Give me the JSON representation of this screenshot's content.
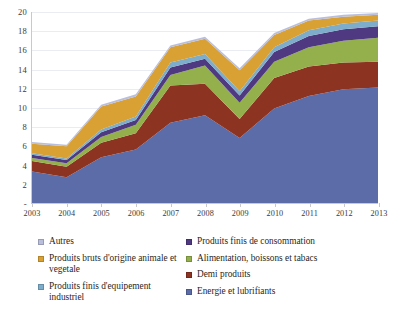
{
  "chart_data": {
    "type": "area",
    "stacked": true,
    "title": "",
    "subtitle": "",
    "xlabel": "",
    "ylabel": "",
    "grid": true,
    "legend_position": "bottom",
    "xlim": [
      2003,
      2013
    ],
    "ylim": [
      0,
      20
    ],
    "yticks": [
      0,
      2,
      4,
      6,
      8,
      10,
      12,
      14,
      16,
      18,
      20
    ],
    "ytick_labels": [
      "-",
      "2",
      "4",
      "6",
      "8",
      "10",
      "12",
      "14",
      "16",
      "18",
      "20"
    ],
    "categories": [
      "2003",
      "2004",
      "2005",
      "2006",
      "2007",
      "2008",
      "2009",
      "2010",
      "2011",
      "2012",
      "2013"
    ],
    "x": [
      2003,
      2004,
      2005,
      2006,
      2007,
      2008,
      2009,
      2010,
      2011,
      2012,
      2013
    ],
    "series": [
      {
        "name": "Energie et lubrifiants",
        "color": "#5b6ca8",
        "values": [
          3.3,
          2.7,
          4.8,
          5.6,
          8.4,
          9.2,
          6.8,
          9.9,
          11.2,
          11.9,
          12.1
        ]
      },
      {
        "name": "Demi produits",
        "color": "#8c3322",
        "values": [
          1.1,
          1.1,
          1.5,
          1.7,
          3.9,
          3.3,
          2.0,
          3.2,
          3.1,
          2.8,
          2.7
        ]
      },
      {
        "name": "Alimentation, boissons et tabacs",
        "color": "#93b04c",
        "values": [
          0.3,
          0.35,
          0.6,
          0.9,
          1.1,
          1.9,
          1.7,
          1.7,
          2.0,
          2.3,
          2.5
        ]
      },
      {
        "name": "Produits finis de consommation",
        "color": "#4f3a82",
        "values": [
          0.35,
          0.35,
          0.5,
          0.5,
          0.8,
          0.7,
          0.75,
          1.0,
          1.2,
          1.2,
          1.2
        ]
      },
      {
        "name": "Produits finis d'equipement industriel",
        "color": "#7dadcb",
        "values": [
          0.15,
          0.15,
          0.3,
          0.35,
          0.5,
          0.5,
          0.45,
          0.5,
          0.6,
          0.6,
          0.6
        ]
      },
      {
        "name": "Produits bruts d'origine animale et vegetale",
        "color": "#d9a033",
        "values": [
          1.0,
          1.3,
          2.4,
          2.1,
          1.6,
          1.6,
          2.2,
          1.3,
          1.0,
          0.7,
          0.6
        ]
      },
      {
        "name": "Autres",
        "color": "#b9bedc",
        "values": [
          0.2,
          0.15,
          0.2,
          0.25,
          0.2,
          0.2,
          0.2,
          0.2,
          0.2,
          0.2,
          0.2
        ]
      }
    ],
    "totals": [
      6.4,
      6.1,
      10.3,
      11.4,
      16.5,
      17.4,
      14.1,
      17.8,
      19.3,
      19.7,
      19.9
    ]
  },
  "legend": {
    "left_column": [
      {
        "label": "Autres",
        "color": "#b9bedc"
      },
      {
        "label": "Produits bruts d'origine animale et vegetale",
        "color": "#d9a033"
      },
      {
        "label": "Produits finis d'equipement industriel",
        "color": "#7dadcb"
      }
    ],
    "right_column": [
      {
        "label": "Produits finis de consommation",
        "color": "#4f3a82"
      },
      {
        "label": "Alimentation, boissons et tabacs",
        "color": "#93b04c"
      },
      {
        "label": "Demi produits",
        "color": "#8c3322"
      },
      {
        "label": "Energie et lubrifiants",
        "color": "#5b6ca8"
      }
    ]
  }
}
